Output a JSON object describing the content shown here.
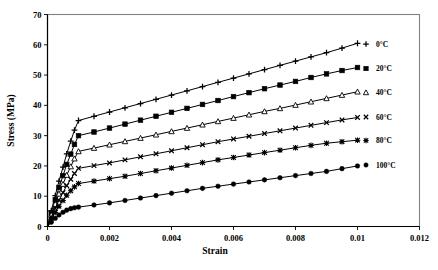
{
  "chart_data": {
    "type": "line",
    "title": "",
    "xlabel": "Strain",
    "ylabel": "Stress (MPa)",
    "xlim": [
      0,
      0.012
    ],
    "ylim": [
      0,
      70
    ],
    "xticks": [
      "0",
      "0.002",
      "0.004",
      "0.006",
      "0.008",
      "0.01",
      "0.012"
    ],
    "xtick_values": [
      0,
      0.002,
      0.004,
      0.006,
      0.008,
      0.01,
      0.012
    ],
    "yticks": [
      "0",
      "10",
      "20",
      "30",
      "40",
      "50",
      "60",
      "70"
    ],
    "ytick_values": [
      0,
      10,
      20,
      30,
      40,
      50,
      60,
      70
    ],
    "grid": false,
    "legend_position": "right-inside",
    "series": [
      {
        "name": "0°C",
        "marker": "plus",
        "x": [
          0,
          0.00012,
          0.00025,
          0.00037,
          0.0005,
          0.00062,
          0.00075,
          0.00087,
          0.001,
          0.0015,
          0.002,
          0.0025,
          0.003,
          0.0035,
          0.004,
          0.0045,
          0.005,
          0.0055,
          0.006,
          0.0065,
          0.007,
          0.0075,
          0.008,
          0.0085,
          0.009,
          0.0095,
          0.01
        ],
        "y": [
          0,
          5.2,
          10.2,
          15.0,
          19.6,
          24.0,
          28.2,
          31.8,
          35.0,
          36.4,
          37.8,
          39.2,
          40.6,
          42.0,
          43.4,
          44.8,
          46.2,
          47.6,
          49.0,
          50.4,
          51.8,
          53.2,
          54.6,
          56.0,
          57.4,
          58.9,
          60.5
        ]
      },
      {
        "name": "20°C",
        "marker": "square",
        "x": [
          0,
          0.00012,
          0.00025,
          0.00037,
          0.0005,
          0.00062,
          0.00075,
          0.00087,
          0.001,
          0.0015,
          0.002,
          0.0025,
          0.003,
          0.0035,
          0.004,
          0.0045,
          0.005,
          0.0055,
          0.006,
          0.0065,
          0.007,
          0.0075,
          0.008,
          0.0085,
          0.009,
          0.0095,
          0.01
        ],
        "y": [
          0,
          4.5,
          8.8,
          12.9,
          16.8,
          20.5,
          23.9,
          27.1,
          30.0,
          31.2,
          32.5,
          33.8,
          35.1,
          36.4,
          37.7,
          39.0,
          40.3,
          41.6,
          42.9,
          44.2,
          45.5,
          46.7,
          47.9,
          49.2,
          50.4,
          51.5,
          52.5
        ]
      },
      {
        "name": "40°C",
        "marker": "triangle",
        "x": [
          0,
          0.00012,
          0.00025,
          0.00037,
          0.0005,
          0.00062,
          0.00075,
          0.00087,
          0.001,
          0.0015,
          0.002,
          0.0025,
          0.003,
          0.0035,
          0.004,
          0.0045,
          0.005,
          0.0055,
          0.006,
          0.0065,
          0.007,
          0.0075,
          0.008,
          0.0085,
          0.009,
          0.0095,
          0.01
        ],
        "y": [
          0,
          3.8,
          7.4,
          10.8,
          14.0,
          17.0,
          19.8,
          22.4,
          24.8,
          25.9,
          27.0,
          28.1,
          29.2,
          30.3,
          31.4,
          32.5,
          33.6,
          34.7,
          35.8,
          36.9,
          38.0,
          39.0,
          40.1,
          41.2,
          42.3,
          43.4,
          44.5
        ]
      },
      {
        "name": "60°C",
        "marker": "cross",
        "x": [
          0,
          0.00012,
          0.00025,
          0.00037,
          0.0005,
          0.00062,
          0.00075,
          0.00087,
          0.001,
          0.0015,
          0.002,
          0.0025,
          0.003,
          0.0035,
          0.004,
          0.0045,
          0.005,
          0.0055,
          0.006,
          0.0065,
          0.007,
          0.0075,
          0.008,
          0.0085,
          0.009,
          0.0095,
          0.01
        ],
        "y": [
          0,
          3.1,
          6.0,
          8.7,
          11.2,
          13.5,
          15.6,
          17.5,
          19.2,
          20.1,
          21.0,
          22.0,
          23.0,
          24.0,
          25.0,
          26.0,
          27.0,
          28.0,
          28.9,
          29.8,
          30.7,
          31.6,
          32.5,
          33.4,
          34.3,
          35.2,
          36.0
        ]
      },
      {
        "name": "80°C",
        "marker": "star",
        "x": [
          0,
          0.00012,
          0.00025,
          0.00037,
          0.0005,
          0.00062,
          0.00075,
          0.00087,
          0.001,
          0.0015,
          0.002,
          0.0025,
          0.003,
          0.0035,
          0.004,
          0.0045,
          0.005,
          0.0055,
          0.006,
          0.0065,
          0.007,
          0.0075,
          0.008,
          0.0085,
          0.009,
          0.0095,
          0.01
        ],
        "y": [
          0,
          2.4,
          4.6,
          6.7,
          8.6,
          10.3,
          11.8,
          13.1,
          14.2,
          15.0,
          15.8,
          16.6,
          17.5,
          18.4,
          19.3,
          20.2,
          21.1,
          22.0,
          22.8,
          23.6,
          24.4,
          25.2,
          26.0,
          26.8,
          27.5,
          28.0,
          28.5
        ]
      },
      {
        "name": "100°C",
        "marker": "circle",
        "x": [
          0,
          0.00012,
          0.00025,
          0.00037,
          0.0005,
          0.00062,
          0.00075,
          0.00087,
          0.001,
          0.0015,
          0.002,
          0.0025,
          0.003,
          0.0035,
          0.004,
          0.0045,
          0.005,
          0.0055,
          0.006,
          0.0065,
          0.007,
          0.0075,
          0.008,
          0.0085,
          0.009,
          0.0095,
          0.01
        ],
        "y": [
          0,
          1.4,
          2.7,
          3.8,
          4.7,
          5.4,
          5.9,
          6.2,
          6.4,
          7.1,
          7.8,
          8.6,
          9.4,
          10.2,
          11.0,
          11.8,
          12.6,
          13.3,
          14.0,
          14.7,
          15.4,
          16.1,
          16.8,
          17.5,
          18.2,
          19.1,
          20.0
        ]
      }
    ],
    "legend_entries": [
      {
        "label": "0°C",
        "marker": "plus"
      },
      {
        "label": "20°C",
        "marker": "square"
      },
      {
        "label": "40°C",
        "marker": "triangle"
      },
      {
        "label": "60°C",
        "marker": "cross"
      },
      {
        "label": "80°C",
        "marker": "star"
      },
      {
        "label": "100°C",
        "marker": "circle"
      }
    ],
    "colors": {
      "line": "#000000",
      "frame": "#808080",
      "axis": "#000000",
      "background": "#ffffff"
    }
  }
}
